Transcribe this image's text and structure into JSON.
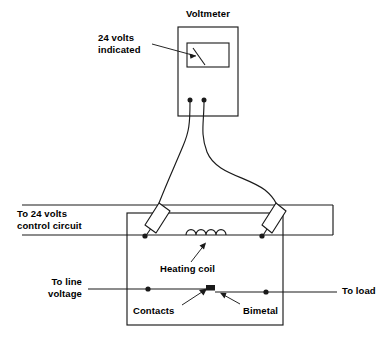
{
  "diagram": {
    "type": "electrical-schematic",
    "stroke_color": "#1a1a1a",
    "background_color": "#ffffff"
  },
  "labels": {
    "voltmeter": "Voltmeter",
    "indication_line1": "24 volts",
    "indication_line2": "indicated",
    "control_line1": "To 24 volts",
    "control_line2": "control circuit",
    "line_voltage_line1": "To line",
    "line_voltage_line2": "voltage",
    "to_load": "To load",
    "heating_coil": "Heating coil",
    "contacts": "Contacts",
    "bimetal": "Bimetal"
  },
  "components": {
    "voltmeter_body": "voltmeter-case",
    "meter_face": "meter-scale-window",
    "meter_needle": "meter-pointer",
    "terminal_left": "voltmeter-terminal-negative",
    "terminal_right": "voltmeter-terminal-positive",
    "probe_left": "test-probe-left",
    "probe_right": "test-probe-right",
    "lead_left": "test-lead-left",
    "lead_right": "test-lead-right",
    "relay_enclosure": "relay-housing",
    "coil": "heating-coil-winding",
    "contact_block": "contact-point",
    "bimetal_arm": "bimetal-strip",
    "rail_upper": "control-rail-upper",
    "rail_lower": "control-rail-lower",
    "line_in": "line-voltage-input",
    "load_out": "load-output"
  },
  "measurement": {
    "value": "24",
    "unit": "volts",
    "instrument": "Voltmeter"
  }
}
